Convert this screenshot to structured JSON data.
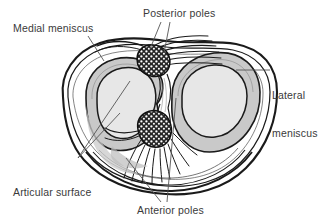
{
  "figure": {
    "background_color": "#ffffff",
    "width": 330,
    "height": 222
  },
  "labels": {
    "medial_meniscus": "Medial meniscus",
    "posterior_poles": "Posterior poles",
    "lateral_meniscus_line1": "Lateral",
    "lateral_meniscus_line2": "meniscus",
    "articular_surface_line1": "Articular surface",
    "articular_surface_line2": "of tibia",
    "anterior_poles": "Anterior poles"
  },
  "colors": {
    "ink": "#1a1a1a",
    "text": "#3a3a3a",
    "meniscus_fill": "#c9c9c9",
    "articular_fill": "#e2e2e2",
    "plateau_fill": "#ffffff",
    "pole_fill": "#2b2b2b",
    "pole_speckle": "#ffffff",
    "leader_line": "#555555"
  },
  "structures": [
    {
      "name": "tibial-plateau-outline",
      "description": "Outer bone contour of the superior tibia, kidney/heart shaped, flattened superiorly"
    },
    {
      "name": "medial-meniscus",
      "description": "C-shaped gray fibrocartilage ring on the left (medial) compartment",
      "side": "medial",
      "fill": "#c9c9c9"
    },
    {
      "name": "lateral-meniscus",
      "description": "More circular gray fibrocartilage ring on the right (lateral) compartment",
      "side": "lateral",
      "fill": "#c9c9c9"
    },
    {
      "name": "medial-articular-surface",
      "description": "Light oval articular surface of the medial tibial condyle",
      "fill": "#e2e2e2"
    },
    {
      "name": "lateral-articular-surface",
      "description": "Light circular articular surface of the lateral tibial condyle",
      "fill": "#e2e2e2"
    },
    {
      "name": "posterior-pole-attachment",
      "description": "Stippled dark attachment blob of the posterior horns in the intercondylar area"
    },
    {
      "name": "anterior-pole-attachment",
      "description": "Stippled dark attachment blob of the anterior horns in the intercondylar area"
    },
    {
      "name": "posterior-fiber-fan",
      "description": "Radiating ligamentous fibers spreading from the posterior poles"
    },
    {
      "name": "anterior-fiber-fan",
      "description": "Radiating ligamentous fibers spreading from the anterior poles"
    }
  ],
  "leaders": [
    {
      "name": "leader-medial-meniscus",
      "from": [
        88,
        36
      ],
      "to": [
        104,
        61
      ]
    },
    {
      "name": "leader-posterior-poles-a",
      "from": [
        160,
        22
      ],
      "to": [
        150,
        48
      ]
    },
    {
      "name": "leader-posterior-poles-b",
      "from": [
        170,
        22
      ],
      "to": [
        164,
        52
      ]
    },
    {
      "name": "leader-lateral-meniscus",
      "from": [
        270,
        70
      ],
      "to": [
        236,
        70
      ]
    },
    {
      "name": "leader-articular-a",
      "from": [
        78,
        158
      ],
      "to": [
        128,
        80
      ]
    },
    {
      "name": "leader-articular-b",
      "from": [
        78,
        158
      ],
      "to": [
        112,
        118
      ]
    },
    {
      "name": "leader-anterior-poles-a",
      "from": [
        160,
        202
      ],
      "to": [
        128,
        160
      ]
    },
    {
      "name": "leader-anterior-poles-b",
      "from": [
        166,
        202
      ],
      "to": [
        172,
        100
      ]
    }
  ]
}
